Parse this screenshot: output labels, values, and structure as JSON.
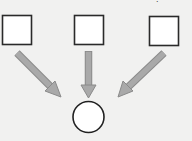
{
  "diagram": {
    "type": "many-to-one flow",
    "background": "#f1f1f0",
    "top_mark_text": ".",
    "sources": [
      {
        "id": "source-left",
        "shape": "square",
        "x": 2,
        "y": 15,
        "size": 29
      },
      {
        "id": "source-middle",
        "shape": "square",
        "x": 74,
        "y": 15,
        "size": 29
      },
      {
        "id": "source-right",
        "shape": "square",
        "x": 149,
        "y": 16,
        "size": 29
      }
    ],
    "target": {
      "id": "target",
      "shape": "circle",
      "cx": 88.5,
      "cy": 117,
      "r": 15.5
    },
    "arrows": [
      {
        "from": "source-left",
        "to": "target",
        "x1": 17,
        "y1": 53,
        "x2": 60,
        "y2": 97
      },
      {
        "from": "source-middle",
        "to": "target",
        "x1": 88.5,
        "y1": 51,
        "x2": 88.5,
        "y2": 97
      },
      {
        "from": "source-right",
        "to": "target",
        "x1": 164,
        "y1": 53,
        "x2": 118,
        "y2": 97
      }
    ],
    "colors": {
      "shape_stroke": "#2a2a2a",
      "shape_fill": "#ffffff",
      "arrow_fill": "#a9a9a9",
      "arrow_stroke": "#8a8a8a"
    }
  }
}
